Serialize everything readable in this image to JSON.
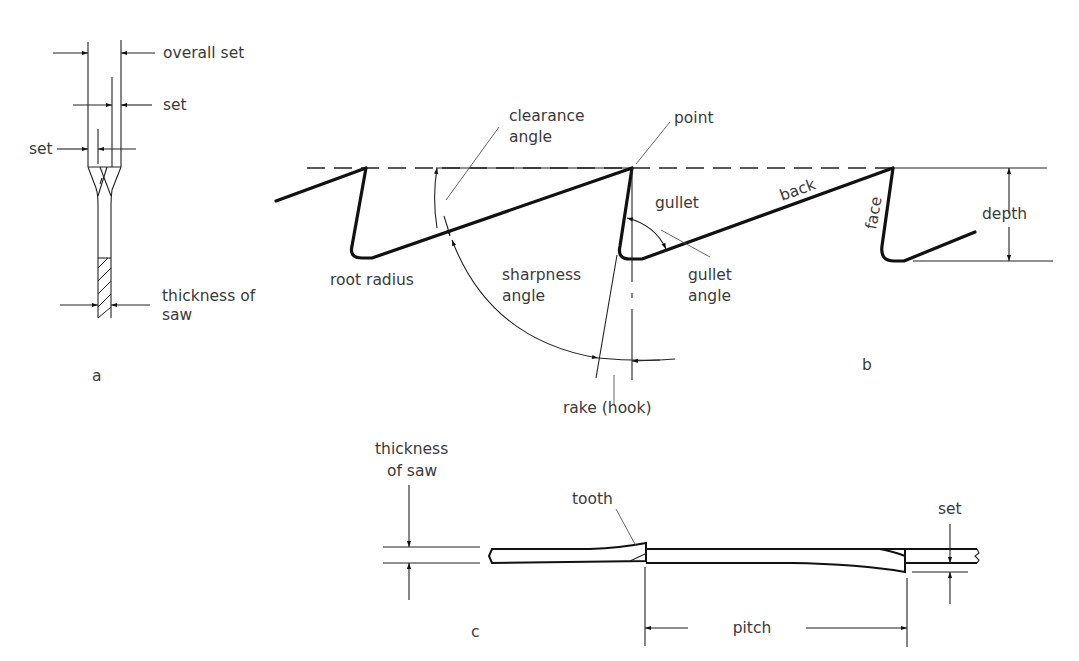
{
  "figure": {
    "panels": {
      "a": {
        "caption": "a",
        "labels": {
          "overall_set": "overall set",
          "set_right": "set",
          "set_left": "set",
          "thickness_line1": "thickness of",
          "thickness_line2": "saw"
        }
      },
      "b": {
        "caption": "b",
        "labels": {
          "clearance_line1": "clearance",
          "clearance_line2": "angle",
          "point": "point",
          "gullet": "gullet",
          "back": "back",
          "face": "face",
          "depth": "depth",
          "root_radius": "root radius",
          "sharpness_line1": "sharpness",
          "sharpness_line2": "angle",
          "gullet_angle_line1": "gullet",
          "gullet_angle_line2": "angle",
          "rake": "rake (hook)"
        }
      },
      "c": {
        "caption": "c",
        "labels": {
          "thickness_line1": "thickness",
          "thickness_line2": "of saw",
          "tooth": "tooth",
          "set": "set",
          "pitch": "pitch"
        }
      }
    },
    "colors": {
      "line": "#111111",
      "text": "#3a3a3a",
      "background": "#ffffff"
    }
  }
}
